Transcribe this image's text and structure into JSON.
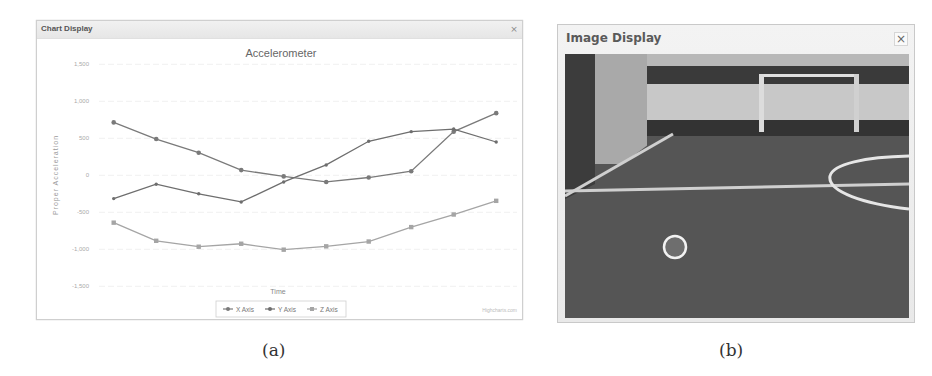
{
  "chart_window": {
    "title": "Chart Display",
    "close_label": "×"
  },
  "image_window": {
    "title": "Image Display",
    "close_label": "×"
  },
  "captions": {
    "a": "(a)",
    "b": "(b)"
  },
  "credits": "Highcharts.com",
  "chart_data": {
    "type": "line",
    "title": "Accelerometer",
    "xlabel": "Time",
    "ylabel": "Proper Acceleration",
    "ylim": [
      -1500,
      1500
    ],
    "y_ticks": [
      1500,
      1000,
      500,
      0,
      -500,
      -1000,
      -1500
    ],
    "y_tick_labels": [
      "1,500",
      "1,000",
      "500",
      "0",
      "-500",
      "-1,000",
      "-1,500"
    ],
    "grid": true,
    "legend_position": "bottom-center",
    "x": [
      1,
      2,
      3,
      4,
      5,
      6,
      7,
      8,
      9,
      10
    ],
    "series": [
      {
        "name": "X Axis",
        "marker": "diamond",
        "color": "#7a7a7a",
        "values": [
          715,
          490,
          305,
          70,
          -15,
          -90,
          -30,
          55,
          590,
          840
        ]
      },
      {
        "name": "Y Axis",
        "marker": "triangle",
        "color": "#6e6e6e",
        "values": [
          -315,
          -120,
          -250,
          -360,
          -90,
          140,
          460,
          590,
          625,
          450
        ]
      },
      {
        "name": "Z Axis",
        "marker": "square",
        "color": "#a5a5a5",
        "values": [
          -640,
          -885,
          -965,
          -925,
          -1005,
          -960,
          -895,
          -700,
          -530,
          -345
        ]
      }
    ]
  },
  "camera_scene": {
    "description": "robot soccer field with goal and ball",
    "ball_detected": true
  }
}
